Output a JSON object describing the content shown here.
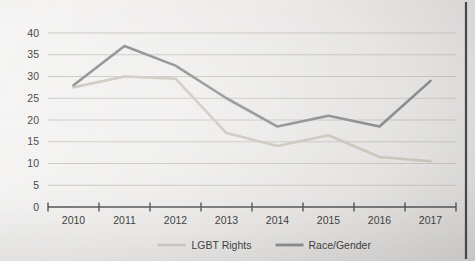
{
  "chart_data": {
    "type": "line",
    "title": "",
    "xlabel": "",
    "ylabel": "",
    "categories": [
      "2010",
      "2011",
      "2012",
      "2013",
      "2014",
      "2015",
      "2016",
      "2017"
    ],
    "series": [
      {
        "name": "LGBT Rights",
        "color": "#c9c6bc",
        "values": [
          27.5,
          30,
          29.5,
          17,
          14,
          16.5,
          11.5,
          10.5
        ]
      },
      {
        "name": "Race/Gender",
        "color": "#8c8c8c",
        "values": [
          28,
          37,
          32.5,
          25,
          18.5,
          21,
          18.5,
          29
        ]
      }
    ],
    "ylim": [
      0,
      40
    ],
    "ytick_step": 5,
    "yticks": [
      "0",
      "5",
      "10",
      "15",
      "20",
      "25",
      "30",
      "35",
      "40"
    ],
    "grid": true,
    "legend_position": "bottom",
    "axis_color": "#555555",
    "gridline_color": "#c4c2bd",
    "text_color": "#3f3f3f",
    "background_color": "#eceae8"
  },
  "legend": {
    "entries": [
      {
        "label": "LGBT Rights",
        "swatch_color": "#c9c6bc"
      },
      {
        "label": "Race/Gender",
        "swatch_color": "#8c8c8c"
      }
    ]
  }
}
